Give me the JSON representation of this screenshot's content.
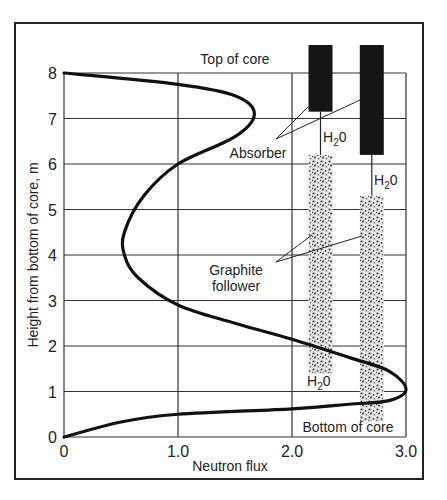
{
  "chart_data": {
    "type": "line",
    "title": "",
    "xlabel": "Neutron flux",
    "ylabel": "Height from bottom of core, m",
    "xlim": [
      0,
      3.0
    ],
    "ylim": [
      0,
      8
    ],
    "x_ticks": [
      "0",
      "1.0",
      "2.0",
      "3.0"
    ],
    "y_ticks": [
      "0",
      "1",
      "2",
      "3",
      "4",
      "5",
      "6",
      "7",
      "8"
    ],
    "grid": true,
    "series": [
      {
        "name": "Axial neutron flux distribution",
        "points": [
          [
            0,
            8
          ],
          [
            1.0,
            7.75
          ],
          [
            1.5,
            7.5
          ],
          [
            1.67,
            7.1
          ],
          [
            1.5,
            6.6
          ],
          [
            1.0,
            6.0
          ],
          [
            0.7,
            5.3
          ],
          [
            0.53,
            4.5
          ],
          [
            0.53,
            4.0
          ],
          [
            0.65,
            3.5
          ],
          [
            1.0,
            2.9
          ],
          [
            1.5,
            2.5
          ],
          [
            2.0,
            2.15
          ],
          [
            2.5,
            1.75
          ],
          [
            2.85,
            1.45
          ],
          [
            3.0,
            1.05
          ],
          [
            2.85,
            0.8
          ],
          [
            2.5,
            0.72
          ],
          [
            2.0,
            0.62
          ],
          [
            1.0,
            0.5
          ],
          [
            0.5,
            0.33
          ],
          [
            0,
            0
          ]
        ]
      }
    ],
    "annotations": {
      "top_of_core": "Top of core",
      "bottom_of_core": "Bottom of core",
      "absorber": "Absorber",
      "graphite_line1": "Graphite",
      "graphite_line2": "follower",
      "h2o_main": "H",
      "h2o_sub": "2",
      "h2o_tail": "0"
    },
    "rods": [
      {
        "absorber_top": 8.5,
        "absorber_bottom": 7.15,
        "water_bottom": 6.2,
        "graphite_bottom": 1.4,
        "x_center": 2.25
      },
      {
        "absorber_top": 8.5,
        "absorber_bottom": 6.2,
        "water_bottom": 5.3,
        "graphite_bottom": 0.35,
        "x_center": 2.7
      }
    ]
  },
  "colors": {
    "ink": "#222222",
    "grid": "#333333",
    "absorber": "#151515",
    "graphite": "#cfcfcf"
  }
}
